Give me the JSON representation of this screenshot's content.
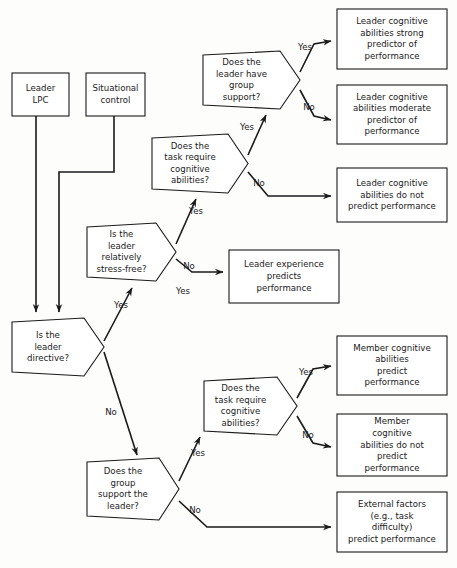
{
  "diagram": {
    "background_color": "#fdfdfc",
    "line_color": "#1a1a1a",
    "node_fill": "#ffffff"
  },
  "nodes": {
    "leader_lpc": {
      "shape": "rect",
      "lines": [
        "Leader",
        "LPC"
      ],
      "x": 12,
      "y": 73,
      "w": 57,
      "h": 43
    },
    "situational_control": {
      "shape": "rect",
      "lines": [
        "Situational",
        "control"
      ],
      "x": 86,
      "y": 73,
      "w": 59,
      "h": 43
    },
    "is_leader_directive": {
      "shape": "hexagon",
      "lines": [
        "Is the",
        "leader",
        "directive?"
      ],
      "x": 12,
      "y": 318,
      "w": 92,
      "h": 58
    },
    "is_leader_stress_free": {
      "shape": "hexagon",
      "lines": [
        "Is the",
        "leader",
        "relatively",
        "stress-free?"
      ],
      "x": 87,
      "y": 223,
      "w": 89,
      "h": 58
    },
    "task_require_cognitive_top": {
      "shape": "hexagon",
      "lines": [
        "Does the",
        "task require",
        "cognitive",
        "abilities?"
      ],
      "x": 152,
      "y": 134,
      "w": 96,
      "h": 59
    },
    "leader_have_group_support": {
      "shape": "hexagon",
      "lines": [
        "Does the",
        "leader have",
        "group",
        "support?"
      ],
      "x": 203,
      "y": 51,
      "w": 97,
      "h": 58
    },
    "group_support_leader": {
      "shape": "hexagon",
      "lines": [
        "Does the",
        "group",
        "support the",
        "leader?"
      ],
      "x": 87,
      "y": 458,
      "w": 92,
      "h": 62
    },
    "task_require_cognitive_bottom": {
      "shape": "hexagon",
      "lines": [
        "Does the",
        "task require",
        "cognitive",
        "abilities?"
      ],
      "x": 204,
      "y": 377,
      "w": 93,
      "h": 58
    },
    "leader_cog_strong": {
      "shape": "rect",
      "lines": [
        "Leader cognitive",
        "abilities strong",
        "predictor of",
        "performance"
      ],
      "x": 337,
      "y": 9,
      "w": 110,
      "h": 60
    },
    "leader_cog_moderate": {
      "shape": "rect",
      "lines": [
        "Leader cognitive",
        "abilities moderate",
        "predictor of",
        "performance"
      ],
      "x": 337,
      "y": 85,
      "w": 110,
      "h": 59
    },
    "leader_cog_no_predict": {
      "shape": "rect",
      "lines": [
        "Leader cognitive",
        "abilities do not",
        "predict performance"
      ],
      "x": 337,
      "y": 168,
      "w": 110,
      "h": 54
    },
    "leader_experience": {
      "shape": "rect",
      "lines": [
        "Leader experience",
        "predicts",
        "performance"
      ],
      "x": 229,
      "y": 250,
      "w": 110,
      "h": 53
    },
    "member_cog_predict": {
      "shape": "rect",
      "lines": [
        "Member cognitive",
        "abilities",
        "predict",
        "performance"
      ],
      "x": 337,
      "y": 336,
      "w": 110,
      "h": 59
    },
    "member_cog_no_predict": {
      "shape": "rect",
      "lines": [
        "Member",
        "cognitive",
        "abilities do not",
        "predict",
        "performance"
      ],
      "x": 337,
      "y": 414,
      "w": 110,
      "h": 62
    },
    "external_factors": {
      "shape": "rect",
      "lines": [
        "External factors",
        "(e.g., task",
        "difficulty)",
        "predict performance"
      ],
      "x": 337,
      "y": 492,
      "w": 110,
      "h": 60
    }
  },
  "edge_labels": {
    "directive_yes": "Yes",
    "directive_no": "No",
    "stress_yes": "Yes",
    "stress_no": "No",
    "task_top_yes": "Yes",
    "task_top_no": "No",
    "support_yes": "Yes",
    "support_no": "No",
    "group_yes": "Yes",
    "group_no": "No",
    "task_bottom_yes": "Yes",
    "task_bottom_no": "No"
  }
}
